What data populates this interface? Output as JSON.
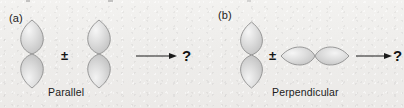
{
  "figure": {
    "background_color": "#efeeec",
    "width": 404,
    "height": 108,
    "orbital_fill": "#d8d8d8",
    "orbital_highlight": "#f4f4f4",
    "orbital_stroke": "#8f8f8f",
    "ink_color": "#1a1a1a"
  },
  "panels": [
    {
      "label": "(a)",
      "operator": "±",
      "arrow": "→",
      "result": "?",
      "caption": "Parallel",
      "orbitals": [
        {
          "name": "p-orbital-vertical-left",
          "orientation": "vertical"
        },
        {
          "name": "p-orbital-vertical-right",
          "orientation": "vertical"
        }
      ]
    },
    {
      "label": "(b)",
      "operator": "±",
      "arrow": "→",
      "result": "?",
      "caption": "Perpendicular",
      "orbitals": [
        {
          "name": "p-orbital-vertical",
          "orientation": "vertical"
        },
        {
          "name": "p-orbital-horizontal",
          "orientation": "horizontal"
        }
      ]
    }
  ]
}
